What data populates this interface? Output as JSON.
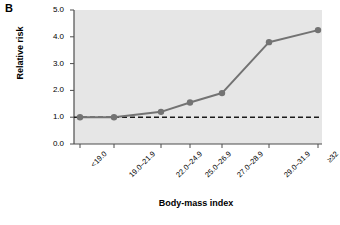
{
  "panel": {
    "label": "B"
  },
  "colors": {
    "plot_background": "#e6e6e6",
    "series": "#737373",
    "reference_line": "#1a1a1a",
    "axis": "#4d4d4d",
    "text": "#000000"
  },
  "chart_data": {
    "type": "line",
    "title": "",
    "subtitle": "",
    "xlabel": "Body-mass index",
    "ylabel": "Relative risk",
    "categories": [
      "<19.0",
      "19.0-21.9",
      "22.0-24.9",
      "25.0-26.9",
      "27.0-28.9",
      "29.0-31.9",
      ">=32"
    ],
    "category_labels": [
      "<19.0",
      "19.0–21.9",
      "22.0–24.9",
      "25.0–26.9",
      "27.0–28.9",
      "29.0–31.9",
      "≥32"
    ],
    "values": [
      1.0,
      1.0,
      1.2,
      1.55,
      1.9,
      3.8,
      4.25
    ],
    "series": [
      {
        "name": "Relative risk",
        "values": [
          1.0,
          1.0,
          1.2,
          1.55,
          1.9,
          3.8,
          4.25
        ]
      }
    ],
    "ylim": [
      0.0,
      5.0
    ],
    "ytick_labels": [
      "0.0",
      "1.0",
      "2.0",
      "3.0",
      "4.0",
      "5.0"
    ],
    "ytick_values": [
      0.0,
      1.0,
      2.0,
      3.0,
      4.0,
      5.0
    ],
    "grid": false,
    "legend": false,
    "legend_position": "none",
    "reference_line": {
      "value": 1.0,
      "style": "dashed"
    },
    "markers": "circle"
  }
}
